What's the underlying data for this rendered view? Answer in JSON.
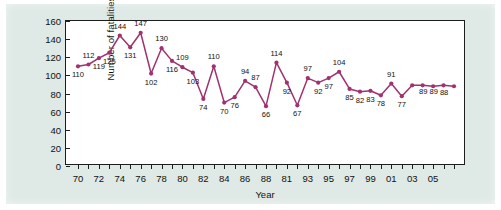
{
  "chart_data": {
    "type": "line",
    "title": "",
    "xlabel": "Year",
    "ylabel": "Number of fatalities",
    "ylim": [
      0,
      160
    ],
    "ytick_step": 20,
    "yticks": [
      0,
      20,
      40,
      60,
      80,
      100,
      120,
      140,
      160
    ],
    "grid": false,
    "legend": "none",
    "marker": "filled-circle",
    "line_color": "#a0326e",
    "marker_color": "#a0326e",
    "x_tick_labels_shown": [
      "70",
      "72",
      "74",
      "76",
      "78",
      "80",
      "82",
      "84",
      "86",
      "88",
      "81",
      "93",
      "95",
      "97",
      "99",
      "01",
      "03",
      "05"
    ],
    "x_tick_label_note": "Labels printed on alternate years; the label at the 1991 position reads '81' in the source scan.",
    "categories": [
      "70",
      "71",
      "72",
      "73",
      "74",
      "75",
      "76",
      "77",
      "78",
      "79",
      "80",
      "81",
      "82",
      "83",
      "84",
      "85",
      "86",
      "87",
      "88",
      "89",
      "90",
      "91",
      "92",
      "93",
      "94",
      "95",
      "96",
      "97",
      "98",
      "99",
      "00",
      "01",
      "02",
      "03",
      "04",
      "05",
      "06"
    ],
    "values": [
      110,
      112,
      119,
      125,
      144,
      131,
      147,
      102,
      130,
      116,
      109,
      103,
      74,
      110,
      70,
      76,
      94,
      87,
      66,
      114,
      92,
      67,
      97,
      92,
      97,
      104,
      85,
      82,
      83,
      78,
      91,
      77,
      89,
      89,
      88,
      89,
      88
    ],
    "point_labels": [
      "110",
      "112",
      "119",
      "125",
      "144",
      "131",
      "147",
      "102",
      "130",
      "116",
      "109",
      "103",
      "74",
      "110",
      "70",
      "76",
      "94",
      "87",
      "66",
      "114",
      "92",
      "67",
      "97",
      "92",
      "97",
      "104",
      "85",
      "82",
      "83",
      "78",
      "91",
      "77",
      "89",
      "89",
      "88",
      "",
      ""
    ],
    "label_positions": [
      "below",
      "above",
      "below",
      "below",
      "above",
      "below",
      "above",
      "below",
      "above",
      "below",
      "above",
      "below",
      "below",
      "above",
      "below",
      "below",
      "above",
      "above",
      "below",
      "above",
      "below",
      "below",
      "above",
      "below",
      "below",
      "above",
      "below",
      "below",
      "below",
      "below",
      "above",
      "below",
      "right",
      "right",
      "right",
      "none",
      "none"
    ]
  },
  "colors": {
    "panel_background": "#dfe9e5",
    "plot_background": "#ffffff",
    "axis": "#1d1d1d",
    "series": "#a0326e",
    "text": "#111111"
  }
}
